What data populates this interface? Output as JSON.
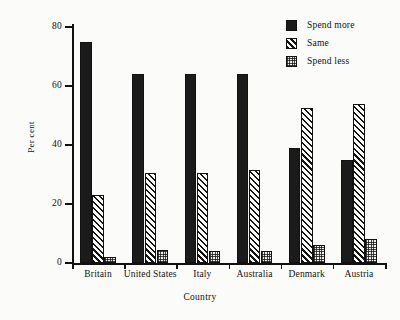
{
  "chart_data": {
    "type": "bar",
    "title": "",
    "xlabel": "Country",
    "ylabel": "Per cent",
    "categories": [
      "Britain",
      "United States",
      "Italy",
      "Australia",
      "Denmark",
      "Austria"
    ],
    "series": [
      {
        "name": "Spend more",
        "pattern": "solid-black",
        "values": [
          75,
          64,
          64,
          64,
          39,
          35
        ]
      },
      {
        "name": "Same",
        "pattern": "diagonal-hatch",
        "values": [
          23,
          30.5,
          30.5,
          31.5,
          52.5,
          54
        ]
      },
      {
        "name": "Spend less",
        "pattern": "fine-stipple",
        "values": [
          2,
          4.5,
          4,
          4,
          6,
          8
        ]
      }
    ],
    "ylim": [
      0,
      80
    ],
    "yticks": [
      0,
      20,
      40,
      60,
      80
    ],
    "ytick_labels": [
      "0",
      "20",
      "40",
      "60",
      "80"
    ],
    "grid": false,
    "legend_position": "top-right",
    "colors": {
      "ink": "#111111",
      "background": "#fbfbf9",
      "spend_more": "#1b1b1b",
      "same": "#fdfdfb",
      "spend_less": "#efeeea"
    }
  }
}
